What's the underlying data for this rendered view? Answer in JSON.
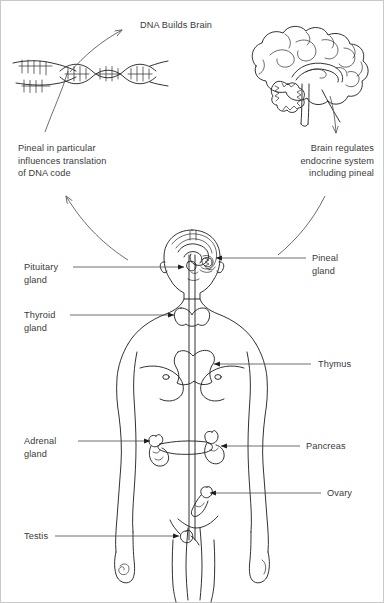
{
  "figure": {
    "title_caption": "DNA Builds Brain",
    "annotations": {
      "top_center": "DNA Builds Brain",
      "left_block": "Pineal in particular\ninfluences translation\nof DNA code",
      "right_block": "Brain regulates\nendocrine system\nincluding pineal"
    },
    "illustrations": [
      {
        "name": "dna-double-helix",
        "caption": "DNA Builds Brain"
      },
      {
        "name": "brain",
        "caption": "Brain regulates endocrine system including pineal"
      },
      {
        "name": "human-body-endocrine",
        "caption": ""
      }
    ],
    "gland_labels_left": [
      {
        "id": "pituitary",
        "text": "Pituitary\ngland"
      },
      {
        "id": "thyroid",
        "text": "Thyroid\ngland"
      },
      {
        "id": "adrenal",
        "text": "Adrenal\ngland"
      },
      {
        "id": "testis",
        "text": "Testis"
      }
    ],
    "gland_labels_right": [
      {
        "id": "pineal",
        "text": "Pineal\ngland"
      },
      {
        "id": "thymus",
        "text": "Thymus"
      },
      {
        "id": "pancreas",
        "text": "Pancreas"
      },
      {
        "id": "ovary",
        "text": "Ovary"
      }
    ],
    "colors": {
      "background": "#ffffff",
      "ink": "#1b1b1b",
      "leader_line": "#4a4a4a",
      "text": "#3a3a3a",
      "frame": "#c9c9c9"
    }
  }
}
